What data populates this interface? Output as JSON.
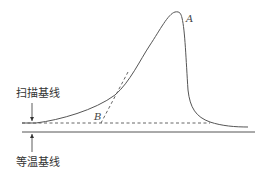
{
  "figure": {
    "labels": {
      "scan_baseline": "扫描基线",
      "isothermal_baseline": "等温基线",
      "point_a": "A",
      "point_b": "B"
    },
    "colors": {
      "curve": "#555555",
      "baseline": "#555555"
    }
  }
}
